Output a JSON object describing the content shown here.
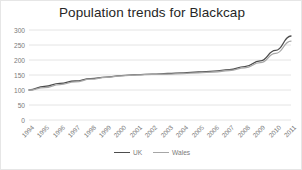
{
  "chart_data": {
    "type": "line",
    "title": "Population trends for Blackcap",
    "xlabel": "",
    "ylabel": "",
    "grid": true,
    "legend_position": "bottom",
    "ylim": [
      0,
      300
    ],
    "yticks": [
      0,
      50,
      100,
      150,
      200,
      250,
      300
    ],
    "ytick_labels": [
      "0",
      "50",
      "100",
      "150",
      "200",
      "250",
      "300"
    ],
    "categories": [
      "1994",
      "1995",
      "1996",
      "1997",
      "1998",
      "1999",
      "2000",
      "2001",
      "2002",
      "2003",
      "2004",
      "2005",
      "2006",
      "2007",
      "2008",
      "2009",
      "2010",
      "2011"
    ],
    "series": [
      {
        "name": "UK",
        "color": "#4d4d4d",
        "values": [
          100,
          112,
          122,
          130,
          138,
          143,
          148,
          151,
          153,
          155,
          157,
          160,
          163,
          168,
          178,
          197,
          232,
          280
        ]
      },
      {
        "name": "Wales",
        "color": "#a6a6a6",
        "values": [
          100,
          108,
          118,
          127,
          136,
          142,
          147,
          150,
          152,
          153,
          155,
          157,
          160,
          165,
          174,
          191,
          222,
          263
        ]
      }
    ],
    "colors": {
      "grid": "#e4e4e4",
      "axis_text": "#7a7a7a",
      "title_text": "#262626",
      "border": "#e6e6e6",
      "background": "#ffffff"
    }
  }
}
